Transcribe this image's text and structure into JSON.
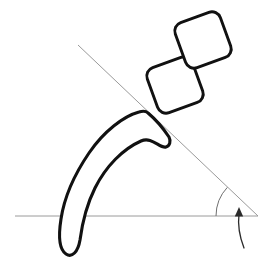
{
  "figure": {
    "background_color": "#ffffff",
    "width": 269,
    "height": 265
  },
  "palette": {
    "outline_color": "#111111",
    "reference_line_color": "#9a9a9a",
    "arc_color": "#6f6f6f",
    "arrow_color": "#2b2b2b",
    "fill_color": "#ffffff"
  },
  "chart_data": {
    "type": "diagram",
    "xlabel": "",
    "ylabel": "",
    "grid": false,
    "legend": "none",
    "xlim": [
      0,
      269
    ],
    "ylim": [
      0,
      265
    ],
    "annotations": [],
    "elements": [
      {
        "name": "horizontal-baseline",
        "kind": "line",
        "x1": 15,
        "y1": 216,
        "x2": 258,
        "y2": 216,
        "color": "#9a9a9a",
        "width": 1
      },
      {
        "name": "diagonal-reference-line",
        "kind": "line",
        "x1": 78,
        "y1": 45,
        "x2": 258,
        "y2": 216,
        "color": "#9a9a9a",
        "width": 1
      },
      {
        "name": "angle-arc",
        "kind": "arc",
        "vertex_x": 258,
        "vertex_y": 216,
        "radius": 42,
        "start_angle_deg": 180,
        "end_angle_deg": 223,
        "color": "#6f6f6f"
      },
      {
        "name": "rotation-arrow",
        "kind": "arrow",
        "from_x": 244,
        "from_y": 248,
        "to_x": 239,
        "to_y": 212,
        "color": "#2b2b2b"
      },
      {
        "name": "claw-outline",
        "kind": "closed-curve",
        "color": "#111111",
        "fill": "#ffffff"
      },
      {
        "name": "proximal-phalanx-square",
        "kind": "rounded-square",
        "center_x": 175,
        "center_y": 85,
        "size": 48,
        "corner_radius": 9,
        "rotation_deg": -34,
        "color": "#111111",
        "fill": "#ffffff"
      },
      {
        "name": "distal-phalanx-square",
        "kind": "rounded-square",
        "center_x": 203,
        "center_y": 40,
        "size": 48,
        "corner_radius": 9,
        "rotation_deg": -34,
        "color": "#111111",
        "fill": "#ffffff"
      }
    ]
  }
}
